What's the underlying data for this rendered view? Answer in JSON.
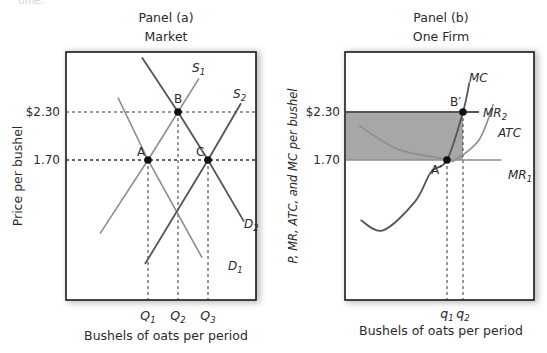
{
  "top_fragment": "time.",
  "chart_data": [
    {
      "type": "line",
      "panel": "Panel (a)",
      "title": "Market",
      "xlabel": "Bushels of oats per period",
      "ylabel": "Price per bushel",
      "y_ticks": [
        {
          "label": "$2.30",
          "value": 2.3
        },
        {
          "label": "1.70",
          "value": 1.7
        }
      ],
      "x_ticks": [
        {
          "label": "Q",
          "sub": "1",
          "value": 1
        },
        {
          "label": "Q",
          "sub": "2",
          "value": 2
        },
        {
          "label": "Q",
          "sub": "3",
          "value": 3
        }
      ],
      "series": [
        {
          "name": "D",
          "sub": "1",
          "kind": "demand",
          "style": "light",
          "points": [
            [
              0.0,
              2.48
            ],
            [
              1,
              1.7
            ],
            [
              2.8,
              0.48
            ]
          ]
        },
        {
          "name": "D",
          "sub": "2",
          "kind": "demand",
          "style": "dark",
          "points": [
            [
              0.8,
              2.98
            ],
            [
              2,
              2.3
            ],
            [
              3,
              1.7
            ],
            [
              4.2,
              0.93
            ]
          ]
        },
        {
          "name": "S",
          "sub": "1",
          "kind": "supply",
          "style": "light",
          "points": [
            [
              -0.6,
              0.78
            ],
            [
              1,
              1.7
            ],
            [
              2,
              2.3
            ],
            [
              2.7,
              2.72
            ]
          ]
        },
        {
          "name": "S",
          "sub": "2",
          "kind": "supply",
          "style": "dark",
          "points": [
            [
              0.9,
              0.4
            ],
            [
              3,
              1.7
            ],
            [
              4.1,
              2.41
            ]
          ]
        }
      ],
      "points": [
        {
          "label": "A",
          "x": 1,
          "y": 1.7
        },
        {
          "label": "B",
          "x": 2,
          "y": 2.3
        },
        {
          "label": "C",
          "x": 3,
          "y": 1.7
        }
      ],
      "grid": false
    },
    {
      "type": "line",
      "panel": "Panel (b)",
      "title": "One Firm",
      "xlabel": "Bushels of oats per period",
      "ylabel": "P, MR, ATC, and MC per bushel",
      "y_ticks": [
        {
          "label": "$2.30",
          "value": 2.3
        },
        {
          "label": "1.70",
          "value": 1.7
        }
      ],
      "x_ticks": [
        {
          "label": "q",
          "sub": "1",
          "value": 1
        },
        {
          "label": "q",
          "sub": "2",
          "value": 2
        }
      ],
      "series": [
        {
          "name": "MC",
          "sub": "",
          "kind": "curve",
          "style": "dark",
          "points": [
            [
              -4.4,
              0.95
            ],
            [
              -3.0,
              0.82
            ],
            [
              -1.0,
              1.18
            ],
            [
              0.0,
              1.55
            ],
            [
              1,
              1.7
            ],
            [
              2,
              2.3
            ],
            [
              2.4,
              2.67
            ]
          ]
        },
        {
          "name": "ATC",
          "sub": "",
          "kind": "curve",
          "style": "light",
          "points": [
            [
              -4.5,
              2.13
            ],
            [
              -2.0,
              1.83
            ],
            [
              1.0,
              1.71
            ],
            [
              1.5,
              1.7
            ],
            [
              3.0,
              1.95
            ],
            [
              3.9,
              2.4
            ]
          ]
        },
        {
          "name": "MR",
          "sub": "2",
          "kind": "horizontal",
          "style": "dark",
          "points": [
            [
              -6.3,
              2.3
            ],
            [
              3.0,
              2.3
            ]
          ]
        },
        {
          "name": "MR",
          "sub": "1",
          "kind": "horizontal",
          "style": "light",
          "points": [
            [
              -6.3,
              1.7
            ],
            [
              4.4,
              1.7
            ]
          ]
        }
      ],
      "points": [
        {
          "label": "A′",
          "x": 1,
          "y": 1.7
        },
        {
          "label": "B′",
          "x": 2,
          "y": 2.3
        }
      ],
      "shaded_region": {
        "x0": -6.3,
        "x1": 2,
        "y0": 1.7,
        "y1": 2.3,
        "color": "#a7a7a7"
      },
      "grid": false
    }
  ]
}
